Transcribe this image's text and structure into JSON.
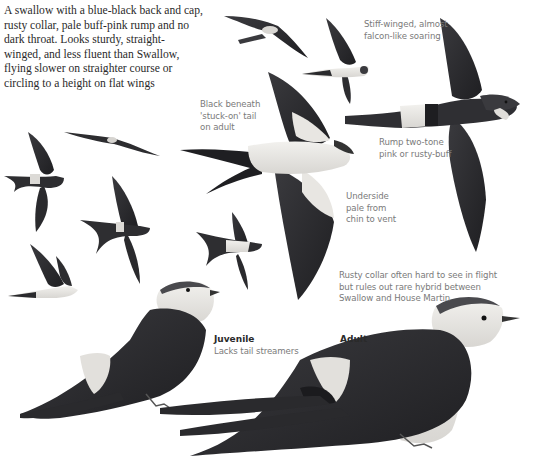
{
  "intro": {
    "text": "A swallow with a blue-black back and cap,\nrusty collar, pale buff-pink rump and no\ndark throat. Looks sturdy, straight-\nwinged, and less fluent than Swallow,\nflying slower on straighter course or\ncircling to a height on flat wings"
  },
  "annotations": {
    "soaring": "Stiff-winged, almost\nfalcon-like soaring",
    "tail": "Black beneath\n'stuck-on' tail\non adult",
    "rump": "Rump two-tone\npink or rusty-buff",
    "underside": "Underside\npale from\nchin to vent",
    "collar": "Rusty collar often hard to see in flight\nbut rules out rare hybrid between\nSwallow and House Martin"
  },
  "labels": {
    "juvenile_title": "Juvenile",
    "juvenile_note": "Lacks tail streamers",
    "adult_title": "Adult"
  },
  "colors": {
    "background": "#ffffff",
    "body_text": "#2a2a2a",
    "note_text": "#7a7a7a",
    "plumage_dark": "#2b2b2e",
    "plumage_mid": "#4a4a4e",
    "plumage_pale": "#e6e4e0"
  }
}
